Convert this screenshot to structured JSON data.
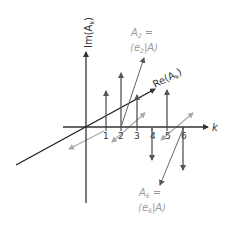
{
  "diagram": {
    "colors": {
      "axis": "#222222",
      "component": "#444444",
      "gray": "#aaaaaa",
      "label_gray": "#999999"
    },
    "axes": {
      "imag_label": "Im(A",
      "imag_sub": "k",
      "imag_close": ")",
      "real_label": "Re(A",
      "real_sub": "k",
      "real_close": ")",
      "k_label": "k"
    },
    "ticks": [
      "1",
      "2",
      "3",
      "4",
      "5",
      "6"
    ],
    "components": [
      {
        "k": 1,
        "direction": "up"
      },
      {
        "k": 2,
        "direction": "up"
      },
      {
        "k": 3,
        "direction": "up"
      },
      {
        "k": 4,
        "direction": "down"
      },
      {
        "k": 5,
        "direction": "up"
      },
      {
        "k": 6,
        "direction": "down"
      }
    ],
    "annotations": {
      "a2": {
        "line1": "A",
        "sub1": "2",
        "eq": " =",
        "bra_open": "⟨e",
        "sub2": "2",
        "ket": "|A⟩"
      },
      "a6": {
        "line1": "A",
        "sub1": "6",
        "eq": " =",
        "bra_open": "⟨e",
        "sub2": "6",
        "ket": "|A⟩"
      }
    }
  }
}
